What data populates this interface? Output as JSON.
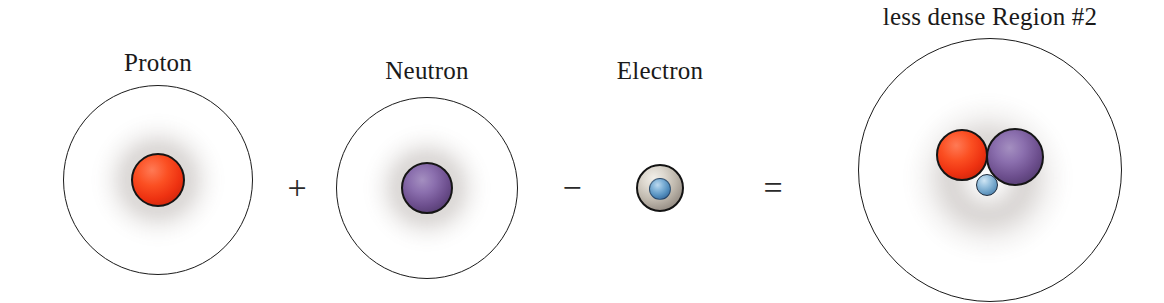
{
  "diagram": {
    "background_color": "#ffffff",
    "width": 1164,
    "height": 303
  },
  "terms": [
    {
      "id": "proton-atom",
      "label": "Proton",
      "label_x": 158,
      "label_y": 50,
      "circle": {
        "cx": 158,
        "cy": 180,
        "r": 95
      },
      "haze": {
        "cx": 158,
        "cy": 180,
        "r": 63
      },
      "particles": [
        {
          "kind": "proton",
          "cx": 158,
          "cy": 180,
          "r": 27,
          "color": "#ee3211"
        }
      ]
    },
    {
      "id": "neutron-atom",
      "label": "Neutron",
      "label_x": 427,
      "label_y": 58,
      "circle": {
        "cx": 427,
        "cy": 188,
        "r": 91
      },
      "haze": {
        "cx": 427,
        "cy": 188,
        "r": 60
      },
      "particles": [
        {
          "kind": "neutron",
          "cx": 427,
          "cy": 188,
          "r": 26,
          "color": "#6d4f8e"
        }
      ]
    },
    {
      "id": "electron-particle",
      "label": "Electron",
      "label_x": 660,
      "label_y": 58,
      "circle": null,
      "haze": null,
      "particles": [
        {
          "kind": "electron-shell",
          "cx": 660,
          "cy": 188,
          "r": 24,
          "color": "#bfb8ad"
        },
        {
          "kind": "electron-core",
          "cx": 660,
          "cy": 189,
          "r": 11,
          "color": "#5590bf"
        }
      ]
    },
    {
      "id": "result-atom",
      "label": "less dense Region #2",
      "label_x": 990,
      "label_y": 4,
      "circle": {
        "cx": 990,
        "cy": 170,
        "r": 132
      },
      "haze": {
        "cx": 988,
        "cy": 178,
        "r": 82
      },
      "particles": [
        {
          "kind": "proton",
          "cx": 962,
          "cy": 155,
          "r": 26,
          "color": "#ee3211"
        },
        {
          "kind": "neutron",
          "cx": 1015,
          "cy": 157,
          "r": 29,
          "color": "#6d4f8e"
        },
        {
          "kind": "electron-small",
          "cx": 987,
          "cy": 185,
          "r": 11,
          "color": "#6b9fc6"
        }
      ]
    }
  ],
  "operators": [
    {
      "id": "plus",
      "glyph": "+",
      "x": 297,
      "y": 188
    },
    {
      "id": "minus",
      "glyph": "−",
      "x": 572,
      "y": 188
    },
    {
      "id": "equals",
      "glyph": "=",
      "x": 773,
      "y": 188
    }
  ],
  "colors": {
    "proton": "#ee3211",
    "neutron": "#6d4f8e",
    "electron": "#5590bf",
    "electron_shell": "#bfb8ad",
    "outline": "#1b1b1b",
    "haze": "#584840",
    "text": "#1a1a1a"
  }
}
